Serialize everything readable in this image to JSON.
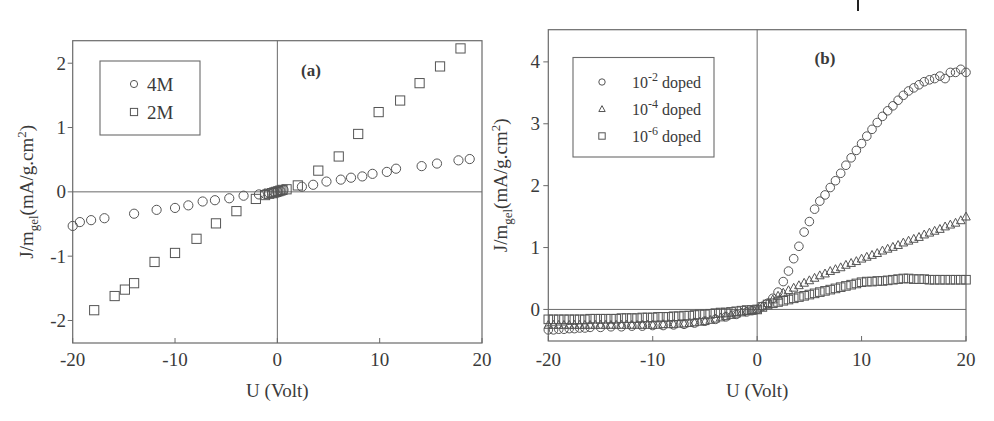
{
  "chart_data": [
    {
      "type": "scatter",
      "panel_label": "(a)",
      "xlabel": "U (Volt)",
      "ylabel": {
        "main": "J/m",
        "sub": "gel",
        "unit": "(mA/g.cm",
        "sup": "2",
        "close": ")"
      },
      "xlim": [
        -20,
        20
      ],
      "ylim": [
        -2.35,
        2.35
      ],
      "xticks": [
        -20,
        -10,
        0,
        10,
        20
      ],
      "yticks": [
        -2,
        -1,
        0,
        1,
        2
      ],
      "grid": false,
      "zero_lines": true,
      "legend_position": "upper-left",
      "series": [
        {
          "name": "4M",
          "marker": "circle",
          "x": [
            -20,
            -19.3,
            -18.2,
            -16.9,
            -14,
            -11.8,
            -10,
            -8.7,
            -7.3,
            -6.1,
            -4.7,
            -3.3,
            -1.8,
            -1.2,
            -0.8,
            -0.5,
            -0.3,
            0,
            0.3,
            0.6,
            2.4,
            3.5,
            4.8,
            6.2,
            7.2,
            8.3,
            9.3,
            10.7,
            11.6,
            14.1,
            15.6,
            17.7,
            18.8
          ],
          "y": [
            -0.53,
            -0.47,
            -0.44,
            -0.41,
            -0.34,
            -0.28,
            -0.25,
            -0.21,
            -0.15,
            -0.13,
            -0.1,
            -0.06,
            -0.04,
            -0.03,
            -0.02,
            -0.01,
            -0.005,
            0,
            0.01,
            0.03,
            0.08,
            0.11,
            0.16,
            0.19,
            0.22,
            0.24,
            0.28,
            0.31,
            0.36,
            0.4,
            0.44,
            0.49,
            0.51
          ]
        },
        {
          "name": "2M",
          "marker": "square",
          "x": [
            -17.9,
            -15.9,
            -14.9,
            -14,
            -12,
            -10,
            -7.9,
            -6,
            -4,
            -2.1,
            -1.2,
            -0.8,
            -0.5,
            -0.3,
            -0.1,
            0.1,
            0.3,
            0.5,
            0.9,
            2,
            4,
            6,
            7.9,
            9.9,
            12,
            13.9,
            15.9,
            17.9
          ],
          "y": [
            -1.84,
            -1.62,
            -1.52,
            -1.42,
            -1.09,
            -0.95,
            -0.73,
            -0.49,
            -0.3,
            -0.11,
            -0.05,
            -0.03,
            -0.02,
            -0.01,
            0,
            0.01,
            0.02,
            0.03,
            0.04,
            0.1,
            0.33,
            0.55,
            0.9,
            1.24,
            1.42,
            1.69,
            1.95,
            2.23
          ]
        }
      ]
    },
    {
      "type": "scatter",
      "panel_label": "(b)",
      "xlabel": "U (Volt)",
      "ylabel": {
        "main": "J/m",
        "sub": "gel",
        "unit": "(mA/g.cm",
        "sup": "2",
        "close": ")"
      },
      "xlim": [
        -20,
        20
      ],
      "ylim": [
        -0.51,
        4.52
      ],
      "xticks": [
        -20,
        -10,
        0,
        10,
        20
      ],
      "yticks": [
        0,
        1,
        2,
        3,
        4
      ],
      "grid": false,
      "zero_lines": true,
      "legend_position": "upper-left",
      "series": [
        {
          "name": "10^-2 doped",
          "legend_base": "10",
          "legend_exp": "-2",
          "legend_suffix": " doped",
          "marker": "circle",
          "x": [
            -20,
            -19.5,
            -19,
            -18.5,
            -18,
            -17.5,
            -17,
            -16.5,
            -16,
            -15,
            -14,
            -13,
            -12,
            -11,
            -10,
            -9,
            -8,
            -7,
            -6,
            -5,
            -4,
            -3,
            -2,
            -1,
            -0.5,
            0,
            0.5,
            1,
            1.5,
            2,
            2.5,
            3,
            3.5,
            4,
            4.5,
            5,
            5.5,
            6,
            6.5,
            7,
            7.5,
            8,
            8.5,
            9,
            9.5,
            10,
            10.5,
            11,
            11.5,
            12,
            12.5,
            13,
            13.5,
            14,
            14.5,
            15,
            15.5,
            16,
            16.5,
            17,
            17.5,
            18,
            18.5,
            19,
            19.5,
            20
          ],
          "y": [
            -0.33,
            -0.33,
            -0.32,
            -0.32,
            -0.31,
            -0.31,
            -0.3,
            -0.3,
            -0.29,
            -0.29,
            -0.28,
            -0.28,
            -0.27,
            -0.27,
            -0.26,
            -0.26,
            -0.25,
            -0.24,
            -0.22,
            -0.19,
            -0.16,
            -0.12,
            -0.08,
            -0.04,
            -0.02,
            0,
            0.05,
            0.1,
            0.18,
            0.28,
            0.45,
            0.62,
            0.82,
            1.02,
            1.25,
            1.42,
            1.62,
            1.75,
            1.85,
            1.97,
            2.08,
            2.2,
            2.33,
            2.45,
            2.57,
            2.68,
            2.8,
            2.91,
            3.02,
            3.12,
            3.21,
            3.29,
            3.38,
            3.46,
            3.53,
            3.58,
            3.63,
            3.68,
            3.71,
            3.73,
            3.77,
            3.73,
            3.83,
            3.83,
            3.88,
            3.83
          ]
        },
        {
          "name": "10^-4 doped",
          "legend_base": "10",
          "legend_exp": "-4",
          "legend_suffix": " doped",
          "marker": "triangle",
          "x": [
            -20,
            -19.5,
            -19,
            -18.5,
            -18,
            -17.5,
            -17,
            -16.5,
            -16,
            -15.5,
            -15,
            -14.5,
            -14,
            -13.5,
            -13,
            -12.5,
            -12,
            -11.5,
            -11,
            -10.5,
            -10,
            -9.5,
            -9,
            -8.5,
            -8,
            -7.5,
            -7,
            -6.5,
            -6,
            -5.5,
            -5,
            -4.5,
            -4,
            -3.5,
            -3,
            -2.5,
            -2,
            -1.5,
            -1,
            -0.5,
            0,
            0.5,
            1,
            1.5,
            2,
            2.5,
            3,
            3.5,
            4,
            4.5,
            5,
            5.5,
            6,
            6.5,
            7,
            7.5,
            8,
            8.5,
            9,
            9.5,
            10,
            10.5,
            11,
            11.5,
            12,
            12.5,
            13,
            13.5,
            14,
            14.5,
            15,
            15.5,
            16,
            16.5,
            17,
            17.5,
            18,
            18.5,
            19,
            19.5,
            20
          ],
          "y": [
            -0.25,
            -0.25,
            -0.25,
            -0.25,
            -0.25,
            -0.25,
            -0.25,
            -0.25,
            -0.25,
            -0.25,
            -0.25,
            -0.25,
            -0.25,
            -0.25,
            -0.25,
            -0.25,
            -0.25,
            -0.25,
            -0.25,
            -0.25,
            -0.25,
            -0.25,
            -0.24,
            -0.24,
            -0.24,
            -0.23,
            -0.23,
            -0.22,
            -0.21,
            -0.2,
            -0.19,
            -0.17,
            -0.15,
            -0.13,
            -0.11,
            -0.09,
            -0.07,
            -0.05,
            -0.03,
            -0.01,
            0,
            0.05,
            0.1,
            0.16,
            0.22,
            0.27,
            0.31,
            0.35,
            0.39,
            0.43,
            0.47,
            0.51,
            0.55,
            0.58,
            0.62,
            0.65,
            0.68,
            0.72,
            0.75,
            0.78,
            0.82,
            0.85,
            0.88,
            0.91,
            0.95,
            0.98,
            1.01,
            1.04,
            1.08,
            1.11,
            1.14,
            1.17,
            1.21,
            1.24,
            1.27,
            1.3,
            1.34,
            1.37,
            1.4,
            1.44,
            1.5
          ]
        },
        {
          "name": "10^-6 doped",
          "legend_base": "10",
          "legend_exp": "-6",
          "legend_suffix": " doped",
          "marker": "square",
          "x": [
            -20,
            -19.5,
            -19,
            -18.5,
            -18,
            -17.5,
            -17,
            -16.5,
            -16,
            -15.5,
            -15,
            -14.5,
            -14,
            -13.5,
            -13,
            -12.5,
            -12,
            -11.5,
            -11,
            -10.5,
            -10,
            -9.5,
            -9,
            -8.5,
            -8,
            -7.5,
            -7,
            -6.5,
            -6,
            -5.5,
            -5,
            -4.5,
            -4,
            -3.5,
            -3,
            -2.5,
            -2,
            -1.5,
            -1,
            -0.5,
            0,
            0.5,
            1,
            1.5,
            2,
            2.5,
            3,
            3.5,
            4,
            4.5,
            5,
            5.5,
            6,
            6.5,
            7,
            7.5,
            8,
            8.5,
            9,
            9.5,
            10,
            10.5,
            11,
            11.5,
            12,
            12.5,
            13,
            13.5,
            14,
            14.5,
            15,
            15.5,
            16,
            16.5,
            17,
            17.5,
            18,
            18.5,
            19,
            19.5,
            20
          ],
          "y": [
            -0.16,
            -0.16,
            -0.16,
            -0.16,
            -0.16,
            -0.16,
            -0.16,
            -0.16,
            -0.15,
            -0.15,
            -0.15,
            -0.15,
            -0.15,
            -0.15,
            -0.14,
            -0.14,
            -0.14,
            -0.14,
            -0.13,
            -0.13,
            -0.13,
            -0.12,
            -0.12,
            -0.12,
            -0.11,
            -0.11,
            -0.1,
            -0.1,
            -0.09,
            -0.08,
            -0.08,
            -0.07,
            -0.06,
            -0.05,
            -0.05,
            -0.04,
            -0.03,
            -0.02,
            -0.01,
            -0.01,
            0,
            0.04,
            0.08,
            0.1,
            0.12,
            0.14,
            0.16,
            0.18,
            0.2,
            0.22,
            0.24,
            0.26,
            0.28,
            0.3,
            0.32,
            0.34,
            0.36,
            0.38,
            0.4,
            0.42,
            0.44,
            0.45,
            0.45,
            0.46,
            0.46,
            0.47,
            0.48,
            0.49,
            0.5,
            0.5,
            0.49,
            0.49,
            0.49,
            0.48,
            0.48,
            0.48,
            0.48,
            0.48,
            0.48,
            0.48,
            0.48
          ]
        }
      ]
    }
  ],
  "layout": {
    "panels": [
      {
        "left": 72.7,
        "right": 482,
        "top": 40.7,
        "bottom": 343,
        "legend": {
          "x": 100,
          "y": 61,
          "w": 100,
          "h": 74,
          "marker_x": 134,
          "text_x": 147,
          "row_y": [
            84,
            112
          ]
        },
        "panel_label_pos": {
          "x": 311,
          "y": 76
        },
        "ylabel_x": 33,
        "ytick_label_x": 66
      },
      {
        "left": 548.3,
        "right": 966,
        "top": 29.7,
        "bottom": 341,
        "legend": {
          "x": 573,
          "y": 57.5,
          "w": 141,
          "h": 99.5,
          "marker_x": 602,
          "text_x": 632,
          "row_y": [
            82,
            109,
            136
          ]
        },
        "panel_label_pos": {
          "x": 825,
          "y": 64
        },
        "ylabel_x": 507,
        "ytick_label_x": 540
      }
    ],
    "xtick_label_y": 366,
    "xlabel_y": 397,
    "colors": {
      "frame": "#6a6a6a",
      "marker": "#555555",
      "text": "#3a3a3a",
      "background": "#ffffff"
    }
  }
}
